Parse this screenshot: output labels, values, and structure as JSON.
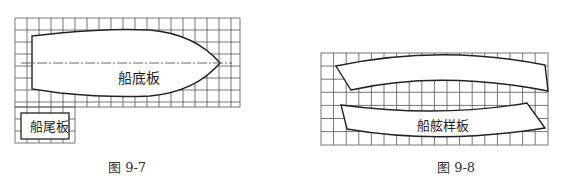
{
  "figures": [
    {
      "id": "fig-9-7",
      "caption": "图 9-7",
      "labels": {
        "bottom_plate": "船底板",
        "transom_plate": "船尾板"
      }
    },
    {
      "id": "fig-9-8",
      "caption": "图 9-8",
      "labels": {
        "gunwale_template": "船舷样板"
      }
    }
  ],
  "colors": {
    "grid": "#555555",
    "outline": "#222222",
    "fill": "#ffffff"
  }
}
